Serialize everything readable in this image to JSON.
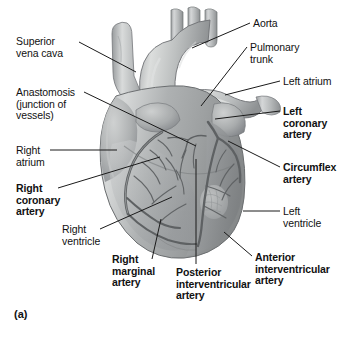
{
  "figure": {
    "panel_letter": "(a)",
    "background_color": "#ffffff",
    "text_color": "#111111",
    "leader_line_color": "#1a1a1a"
  },
  "labels": [
    {
      "id": "superior-vena-cava",
      "text": "Superior\nvena cava",
      "bold": false,
      "align": "left",
      "x": 16,
      "y": 36,
      "leader": {
        "x1": 79,
        "y1": 42,
        "x2": 136,
        "y2": 72
      }
    },
    {
      "id": "anastomosis",
      "text": "Anastomosis\n(junction of\nvessels)",
      "bold": false,
      "align": "left",
      "x": 16,
      "y": 87,
      "leader": {
        "x1": 84,
        "y1": 92,
        "x2": 196,
        "y2": 146
      }
    },
    {
      "id": "right-atrium",
      "text": "Right\natrium",
      "bold": false,
      "align": "left",
      "x": 16,
      "y": 145,
      "leader": {
        "x1": 50,
        "y1": 150,
        "x2": 117,
        "y2": 150
      }
    },
    {
      "id": "right-coronary-artery",
      "text": "Right\ncoronary\nartery",
      "bold": true,
      "align": "left",
      "x": 16,
      "y": 183,
      "leader": {
        "x1": 58,
        "y1": 188,
        "x2": 160,
        "y2": 157
      }
    },
    {
      "id": "right-ventricle",
      "text": "Right\nventricle",
      "bold": false,
      "align": "left",
      "x": 62,
      "y": 224,
      "leader": {
        "x1": 100,
        "y1": 229,
        "x2": 172,
        "y2": 197
      }
    },
    {
      "id": "right-marginal-artery",
      "text": "Right\nmarginal\nartery",
      "bold": true,
      "align": "left",
      "x": 112,
      "y": 254,
      "leader": {
        "x1": 152,
        "y1": 259,
        "x2": 161,
        "y2": 219
      }
    },
    {
      "id": "posterior-interventricular-artery",
      "text": "Posterior\ninterventricular\nartery",
      "bold": true,
      "align": "left",
      "x": 176,
      "y": 267,
      "leader": {
        "x1": 196,
        "y1": 264,
        "x2": 196,
        "y2": 159
      }
    },
    {
      "id": "anterior-interventricular-artery",
      "text": "Anterior\ninterventricular\nartery",
      "bold": true,
      "align": "left",
      "x": 255,
      "y": 252,
      "leader": {
        "x1": 252,
        "y1": 256,
        "x2": 224,
        "y2": 232
      }
    },
    {
      "id": "left-ventricle",
      "text": "Left\nventricle",
      "bold": false,
      "align": "left",
      "x": 283,
      "y": 206,
      "leader": {
        "x1": 280,
        "y1": 211,
        "x2": 243,
        "y2": 211
      }
    },
    {
      "id": "circumflex-artery",
      "text": "Circumflex\nartery",
      "bold": true,
      "align": "left",
      "x": 283,
      "y": 162,
      "leader": {
        "x1": 280,
        "y1": 167,
        "x2": 228,
        "y2": 141
      }
    },
    {
      "id": "left-coronary-artery",
      "text": "Left\ncoronary\nartery",
      "bold": true,
      "align": "left",
      "x": 283,
      "y": 106,
      "leader": {
        "x1": 280,
        "y1": 111,
        "x2": 215,
        "y2": 119
      }
    },
    {
      "id": "left-atrium",
      "text": "Left atrium",
      "bold": false,
      "align": "left",
      "x": 283,
      "y": 76,
      "leader": {
        "x1": 280,
        "y1": 81,
        "x2": 225,
        "y2": 95
      }
    },
    {
      "id": "pulmonary-trunk",
      "text": "Pulmonary\ntrunk",
      "bold": false,
      "align": "left",
      "x": 250,
      "y": 42,
      "leader": {
        "x1": 247,
        "y1": 47,
        "x2": 201,
        "y2": 106
      }
    },
    {
      "id": "aorta",
      "text": "Aorta",
      "bold": false,
      "align": "left",
      "x": 253,
      "y": 18,
      "leader": {
        "x1": 250,
        "y1": 23,
        "x2": 192,
        "y2": 48
      }
    }
  ],
  "anatomy_structures": [
    "superior vena cava",
    "aortic arch",
    "brachiocephalic trunk",
    "left common carotid artery",
    "left subclavian artery",
    "pulmonary trunk",
    "left atrium / auricle",
    "right atrium / auricle",
    "right ventricle",
    "left ventricle",
    "right coronary artery",
    "left coronary artery",
    "circumflex artery",
    "anterior interventricular artery",
    "right marginal artery",
    "posterior interventricular artery",
    "anastomosis"
  ]
}
